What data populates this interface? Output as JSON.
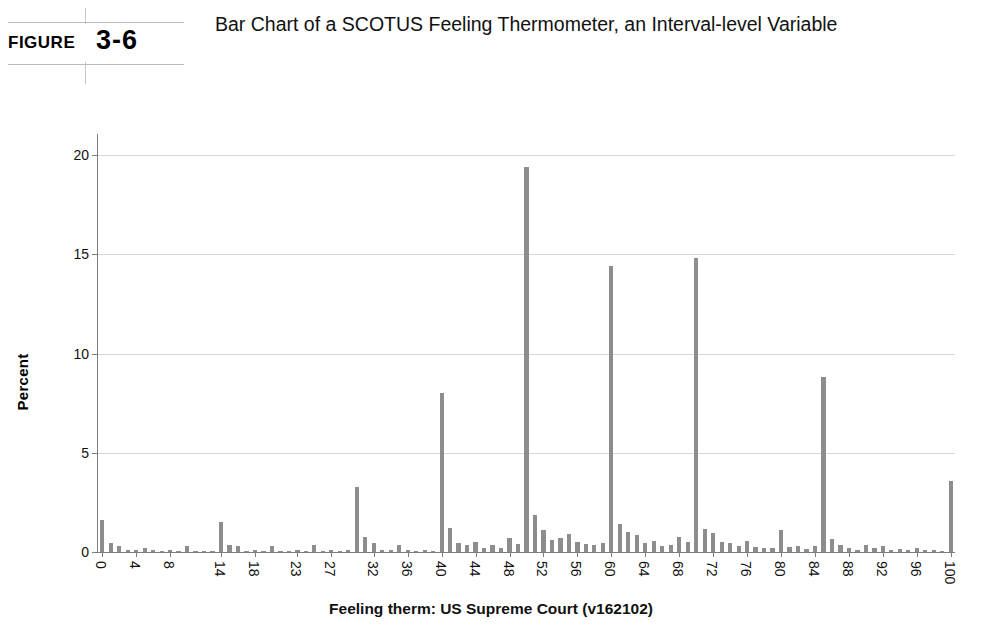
{
  "figure": {
    "label": "FIGURE",
    "number": "3-6",
    "title": "Bar Chart of a SCOTUS Feeling Thermometer, an Interval-level Variable"
  },
  "chart_data": {
    "type": "bar",
    "title": "",
    "xlabel": "Feeling therm: US Supreme Court (v162102)",
    "ylabel": "Percent",
    "ylim": [
      0,
      21
    ],
    "yticks": [
      0,
      5,
      10,
      15,
      20
    ],
    "ytick_labels": [
      "0",
      "5",
      "10",
      "15",
      "20"
    ],
    "grid": true,
    "legend": "none",
    "bar_color": "#8d8d8d",
    "xtick_labels": [
      "0",
      "4",
      "8",
      "14",
      "18",
      "23",
      "27",
      "32",
      "36",
      "40",
      "44",
      "48",
      "52",
      "56",
      "60",
      "64",
      "68",
      "72",
      "76",
      "80",
      "84",
      "88",
      "92",
      "96",
      "100"
    ],
    "xtick_categories": [
      0,
      4,
      8,
      14,
      18,
      23,
      27,
      32,
      36,
      40,
      44,
      48,
      52,
      56,
      60,
      64,
      68,
      72,
      76,
      80,
      84,
      88,
      92,
      96,
      100
    ],
    "categories": [
      0,
      1,
      2,
      3,
      4,
      5,
      6,
      7,
      8,
      9,
      10,
      11,
      12,
      13,
      14,
      15,
      16,
      17,
      18,
      19,
      20,
      21,
      22,
      23,
      24,
      25,
      26,
      27,
      28,
      29,
      30,
      31,
      32,
      33,
      34,
      35,
      36,
      37,
      38,
      39,
      40,
      41,
      42,
      43,
      44,
      45,
      46,
      47,
      48,
      49,
      50,
      51,
      52,
      53,
      54,
      55,
      56,
      57,
      58,
      59,
      60,
      61,
      62,
      63,
      64,
      65,
      66,
      67,
      68,
      69,
      70,
      71,
      72,
      73,
      74,
      75,
      76,
      77,
      78,
      79,
      80,
      81,
      82,
      83,
      84,
      85,
      86,
      87,
      88,
      89,
      90,
      91,
      92,
      93,
      94,
      95,
      96,
      97,
      98,
      99,
      100
    ],
    "values": [
      1.6,
      0.45,
      0.3,
      0.1,
      0.12,
      0.22,
      0.1,
      0.05,
      0.08,
      0.05,
      0.3,
      0.05,
      0.05,
      0.05,
      1.5,
      0.35,
      0.32,
      0.05,
      0.1,
      0.05,
      0.3,
      0.05,
      0.05,
      0.1,
      0.05,
      0.35,
      0.05,
      0.12,
      0.05,
      0.08,
      3.3,
      0.75,
      0.45,
      0.12,
      0.1,
      0.35,
      0.12,
      0.05,
      0.08,
      0.05,
      8.0,
      1.2,
      0.45,
      0.35,
      0.5,
      0.2,
      0.35,
      0.2,
      0.7,
      0.4,
      19.4,
      1.85,
      1.1,
      0.6,
      0.7,
      0.9,
      0.5,
      0.4,
      0.35,
      0.45,
      14.4,
      1.4,
      1.0,
      0.85,
      0.45,
      0.55,
      0.3,
      0.35,
      0.75,
      0.5,
      14.8,
      1.15,
      0.95,
      0.5,
      0.45,
      0.3,
      0.55,
      0.25,
      0.2,
      0.18,
      1.1,
      0.25,
      0.3,
      0.15,
      0.3,
      8.8,
      0.65,
      0.35,
      0.2,
      0.12,
      0.35,
      0.18,
      0.3,
      0.12,
      0.15,
      0.1,
      0.2,
      0.08,
      0.1,
      0.05,
      3.6
    ]
  }
}
